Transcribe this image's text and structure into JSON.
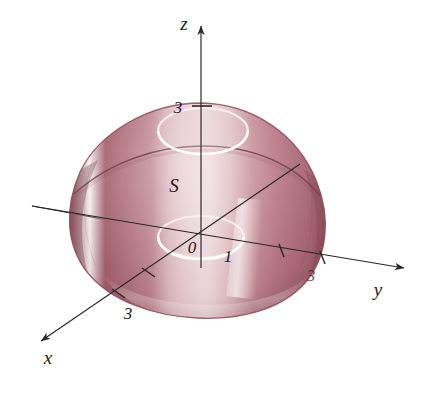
{
  "figure": {
    "background_color": "#ffffff",
    "width": 430,
    "height": 397
  },
  "axes": {
    "z": {
      "label": "z",
      "label_x": 184,
      "label_y": 30,
      "arrow_tip": [
        202,
        22
      ],
      "origin": [
        201,
        237
      ],
      "ticks": [
        {
          "value": "3",
          "label_x": 178,
          "label_y": 113,
          "tick_x": 201,
          "tick_y": 107
        }
      ]
    },
    "y": {
      "label": "y",
      "label_x": 378,
      "label_y": 296,
      "arrow_tip": [
        409,
        269
      ],
      "ticks": [
        {
          "value": "",
          "label_x": 0,
          "label_y": 0,
          "tick_x": 281,
          "tick_y": 250
        },
        {
          "value": "3",
          "label_x": 311,
          "label_y": 281,
          "tick_x": 322,
          "tick_y": 260
        }
      ]
    },
    "x": {
      "label": "x",
      "label_x": 48,
      "label_y": 364,
      "arrow_tip": [
        36,
        343
      ],
      "ticks": [
        {
          "value": "",
          "label_x": 0,
          "label_y": 0,
          "tick_x": 148,
          "tick_y": 274
        },
        {
          "value": "3",
          "label_x": 128,
          "label_y": 319,
          "tick_x": 118,
          "tick_y": 296
        }
      ]
    }
  },
  "surface": {
    "label": "S",
    "label_x": 174,
    "label_y": 192,
    "origin_label": "0",
    "origin_label_x": 192,
    "origin_label_y": 253,
    "radius_label": "1",
    "radius_label_x": 228,
    "radius_label_y": 262
  },
  "colors": {
    "dome_dark": "#9c5a68",
    "dome_mid": "#bb7d89",
    "dome_light": "#e3c0c4",
    "dome_edge": "#8d4d5c",
    "highlight": "#f0dade",
    "ring_white": "#f7eef0",
    "axis_line": "#2a2a2a",
    "text": "#1a1a1a"
  }
}
